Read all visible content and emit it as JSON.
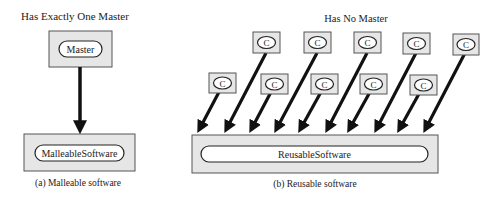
{
  "left_panel": {
    "heading": "Has Exactly One Master",
    "master_label": "Master",
    "target_label": "MalleableSoftware",
    "caption": "(a) Malleable software"
  },
  "right_panel": {
    "heading": "Has No Master",
    "client_label": "C",
    "client_count": 10,
    "target_label": "ReusableSoftware",
    "caption": "(b) Reusable software"
  },
  "colors": {
    "box_fill": "#e6e6e6",
    "stroke": "#333333",
    "arrow": "#111111"
  }
}
